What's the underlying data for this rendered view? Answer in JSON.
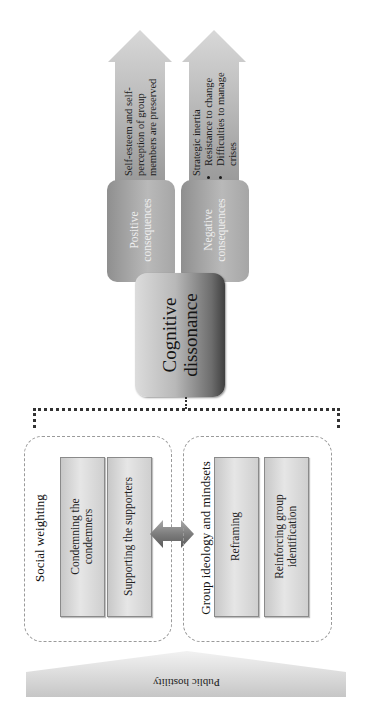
{
  "diagram": {
    "orientation": "rotated -90 degrees (reads bottom-to-top)",
    "outcome_arrows": [
      {
        "id": "positive",
        "text": "Self-esteem and self-perception of group members are preserved",
        "bullets": []
      },
      {
        "id": "negative",
        "text": "Strategic inertia",
        "bullets": [
          "Resistance to change",
          "Difficulties to manage crises"
        ]
      }
    ],
    "consequences": [
      {
        "label": "Positive consequences"
      },
      {
        "label": "Negative consequences"
      }
    ],
    "central_node": {
      "label": "Cognitive dissonance"
    },
    "groups": [
      {
        "title": "Social weighting",
        "items": [
          "Condemning the condemners",
          "Supporting the supporters"
        ]
      },
      {
        "title": "Group ideology and mindsets",
        "items": [
          "Reframing",
          "Reinforcing group identification"
        ]
      }
    ],
    "connector": {
      "type": "double-arrow",
      "between": [
        "Social weighting",
        "Group ideology and mindsets"
      ]
    },
    "base": {
      "label": "Public hostility"
    }
  },
  "colors": {
    "arrow_fill_top": "#d6d6d6",
    "arrow_fill_bottom": "#9d9d9d",
    "consequence_box": "#a8a8a8",
    "central_dark": "#3f3f3f",
    "central_light": "#dcdcdc",
    "inner_box": "#d9d9d9",
    "bracket": "#333333"
  }
}
